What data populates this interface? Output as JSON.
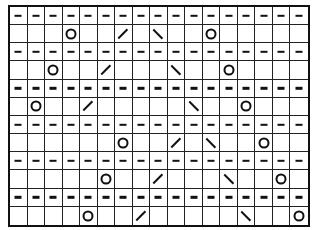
{
  "chart": {
    "columns": 17,
    "rows": 12,
    "symbols": {
      "purl": {
        "glyph": "–",
        "icon": "purl-dash-icon"
      },
      "yo": {
        "glyph": "○",
        "icon": "yarn-over-circle-icon"
      },
      "k2tog": {
        "glyph": "/",
        "icon": "right-slant-decrease-icon"
      },
      "ssk": {
        "glyph": "\\",
        "icon": "left-slant-decrease-icon"
      },
      "knit": {
        "glyph": "",
        "icon": "empty-knit-cell"
      }
    },
    "grid": [
      [
        "purl",
        "purl",
        "purl",
        "purl",
        "purl",
        "purl",
        "purl",
        "purl",
        "purl",
        "purl",
        "purl",
        "purl",
        "purl",
        "purl",
        "purl",
        "purl",
        "purl"
      ],
      [
        "knit",
        "knit",
        "knit",
        "yo",
        "knit",
        "knit",
        "k2tog",
        "knit",
        "ssk",
        "knit",
        "knit",
        "yo",
        "knit",
        "knit",
        "knit",
        "knit",
        "knit"
      ],
      [
        "purl",
        "purl",
        "purl",
        "purl",
        "purl",
        "purl",
        "purl",
        "purl",
        "purl",
        "purl",
        "purl",
        "purl",
        "purl",
        "purl",
        "purl",
        "purl",
        "purl"
      ],
      [
        "knit",
        "knit",
        "yo",
        "knit",
        "knit",
        "k2tog",
        "knit",
        "knit",
        "knit",
        "ssk",
        "knit",
        "knit",
        "yo",
        "knit",
        "knit",
        "knit",
        "knit"
      ],
      [
        "purl",
        "purl",
        "purl",
        "purl",
        "purl",
        "purl",
        "purl",
        "purl",
        "purl",
        "purl",
        "purl",
        "purl",
        "purl",
        "purl",
        "purl",
        "purl",
        "purl"
      ],
      [
        "knit",
        "yo",
        "knit",
        "knit",
        "k2tog",
        "knit",
        "knit",
        "knit",
        "knit",
        "knit",
        "ssk",
        "knit",
        "knit",
        "yo",
        "knit",
        "knit",
        "knit"
      ],
      [
        "purl",
        "purl",
        "purl",
        "purl",
        "purl",
        "purl",
        "purl",
        "purl",
        "purl",
        "purl",
        "purl",
        "purl",
        "purl",
        "purl",
        "purl",
        "purl",
        "purl"
      ],
      [
        "knit",
        "knit",
        "knit",
        "knit",
        "knit",
        "knit",
        "yo",
        "knit",
        "knit",
        "k2tog",
        "knit",
        "ssk",
        "knit",
        "knit",
        "yo",
        "knit",
        "knit"
      ],
      [
        "purl",
        "purl",
        "purl",
        "purl",
        "purl",
        "purl",
        "purl",
        "purl",
        "purl",
        "purl",
        "purl",
        "purl",
        "purl",
        "purl",
        "purl",
        "purl",
        "purl"
      ],
      [
        "knit",
        "knit",
        "knit",
        "knit",
        "knit",
        "yo",
        "knit",
        "knit",
        "k2tog",
        "knit",
        "knit",
        "knit",
        "ssk",
        "knit",
        "knit",
        "yo",
        "knit"
      ],
      [
        "purl",
        "purl",
        "purl",
        "purl",
        "purl",
        "purl",
        "purl",
        "purl",
        "purl",
        "purl",
        "purl",
        "purl",
        "purl",
        "purl",
        "purl",
        "purl",
        "purl"
      ],
      [
        "knit",
        "knit",
        "knit",
        "knit",
        "yo",
        "knit",
        "knit",
        "k2tog",
        "knit",
        "knit",
        "knit",
        "knit",
        "knit",
        "ssk",
        "knit",
        "knit",
        "yo"
      ]
    ]
  }
}
